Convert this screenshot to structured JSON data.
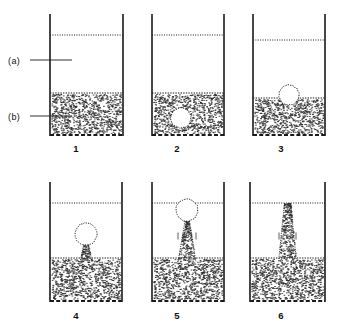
{
  "figure": {
    "background_color": "#ffffff",
    "ink_color": "#1a1a1a",
    "stipple_color": "#2b2b2b"
  },
  "callouts": [
    {
      "id": "callout-a",
      "label": "(a)",
      "refers_to": "bed-surface-freeboard-level",
      "x": 8,
      "y": 56,
      "leader_line": {
        "x1": 30,
        "y1": 60,
        "x2": 72,
        "y2": 60
      }
    },
    {
      "id": "callout-b",
      "label": "(b)",
      "refers_to": "granular-bed-region",
      "x": 8,
      "y": 112,
      "leader_line": {
        "x1": 30,
        "y1": 116,
        "x2": 72,
        "y2": 116
      }
    }
  ],
  "panels": [
    {
      "number": "1",
      "caption_x": 76,
      "caption_y": 143,
      "vessel": {
        "left": 50,
        "right": 123,
        "top": 14,
        "bottom": 136
      },
      "surface_line_y": 35,
      "bed_top_y": 93,
      "bed_bottom_y": 135,
      "bubble": null,
      "stem": null,
      "state": "quiescent-bed-no-bubble"
    },
    {
      "number": "2",
      "caption_x": 177,
      "caption_y": 143,
      "vessel": {
        "left": 152,
        "right": 224,
        "top": 14,
        "bottom": 136
      },
      "surface_line_y": 35,
      "bed_top_y": 93,
      "bed_bottom_y": 135,
      "bubble": {
        "cx": 181,
        "cy": 118,
        "r": 10,
        "type": "void-inside-bed"
      },
      "stem": null,
      "state": "bubble-nucleated-within-bed"
    },
    {
      "number": "3",
      "caption_x": 281,
      "caption_y": 143,
      "vessel": {
        "left": 253,
        "right": 325,
        "top": 14,
        "bottom": 136
      },
      "surface_line_y": 40,
      "bed_top_y": 98,
      "bed_bottom_y": 135,
      "bubble": {
        "cx": 289,
        "cy": 95,
        "r": 10,
        "type": "dome-breaking-bed-surface"
      },
      "stem": null,
      "state": "bubble-reaching-bed-surface"
    },
    {
      "number": "4",
      "caption_x": 76,
      "caption_y": 310,
      "vessel": {
        "left": 50,
        "right": 122,
        "top": 182,
        "bottom": 302
      },
      "surface_line_y": 203,
      "bed_top_y": 258,
      "bed_bottom_y": 301,
      "bubble": {
        "cx": 86,
        "cy": 234,
        "r": 11,
        "type": "detached-rising-bubble"
      },
      "stem": {
        "top_y": 243,
        "bottom_y": 262,
        "top_half_width": 2,
        "bottom_half_width": 6
      },
      "state": "bubble-detached-rising-with-wake"
    },
    {
      "number": "5",
      "caption_x": 177,
      "caption_y": 310,
      "vessel": {
        "left": 152,
        "right": 224,
        "top": 182,
        "bottom": 302
      },
      "surface_line_y": 203,
      "bed_top_y": 258,
      "bed_bottom_y": 301,
      "bubble": {
        "cx": 187,
        "cy": 210,
        "r": 11,
        "type": "bubble-at-freeboard-surface"
      },
      "stem": {
        "top_y": 221,
        "bottom_y": 262,
        "top_half_width": 2,
        "bottom_half_width": 9
      },
      "flow_marks": [
        {
          "x": 178,
          "y": 236,
          "mark": "tick"
        },
        {
          "x": 196,
          "y": 236,
          "mark": "tick"
        }
      ],
      "state": "bubble-erupting-at-surface"
    },
    {
      "number": "6",
      "caption_x": 281,
      "caption_y": 310,
      "vessel": {
        "left": 250,
        "right": 325,
        "top": 182,
        "bottom": 302
      },
      "surface_line_y": 203,
      "bed_top_y": 258,
      "bed_bottom_y": 301,
      "bubble": null,
      "stem": {
        "top_y": 203,
        "bottom_y": 262,
        "top_half_width": 3,
        "bottom_half_width": 9
      },
      "flow_marks": [
        {
          "x": 279,
          "y": 236,
          "mark": "tick"
        },
        {
          "x": 296,
          "y": 236,
          "mark": "tick"
        }
      ],
      "state": "bubble-burst-column-remaining"
    }
  ]
}
